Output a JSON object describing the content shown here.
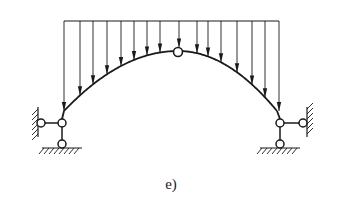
{
  "diagram": {
    "type": "three-hinged arch with distributed vertical load",
    "label": "e)",
    "colors": {
      "stroke": "#1a1a1a",
      "background": "#ffffff"
    },
    "load": {
      "top_y": 21,
      "x_start": 64,
      "x_end": 279,
      "arrow_x": [
        64,
        80,
        93,
        107,
        121,
        134,
        147,
        160,
        179,
        197,
        208,
        221,
        237,
        252,
        265,
        279
      ]
    },
    "arch": {
      "left": [
        64,
        111
      ],
      "crown": [
        178,
        51
      ],
      "right": [
        277,
        111
      ]
    },
    "crown_hinge": {
      "cx": 178,
      "cy": 52,
      "r": 4.5
    },
    "supports": [
      {
        "side": "left",
        "main_hinge": [
          62,
          123
        ],
        "horizontal_link_hinge": [
          41,
          123
        ],
        "vertical_link_hinge": [
          62,
          144
        ],
        "wall_x": 38,
        "ground_y": 148
      },
      {
        "side": "right",
        "main_hinge": [
          280,
          123
        ],
        "horizontal_link_hinge": [
          303,
          123
        ],
        "vertical_link_hinge": [
          280,
          144
        ],
        "wall_x": 307,
        "ground_y": 148
      }
    ]
  }
}
